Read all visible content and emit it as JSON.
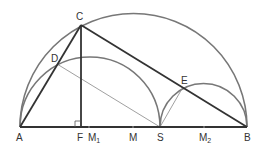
{
  "diagram": {
    "type": "geometry",
    "colors": {
      "arc": "#777777",
      "thick_line": "#333333",
      "thin_line": "#888888",
      "label": "#333333"
    },
    "points": {
      "A": {
        "label": "A",
        "x": 20,
        "y": 127
      },
      "B": {
        "label": "B",
        "x": 247,
        "y": 127
      },
      "C": {
        "label": "C",
        "x": 81,
        "y": 25
      },
      "D": {
        "label": "D",
        "x": 57,
        "y": 64
      },
      "E": {
        "label": "E",
        "x": 183,
        "y": 87
      },
      "F": {
        "label": "F",
        "x": 81,
        "y": 127
      },
      "M1": {
        "label": "M",
        "sub": "1",
        "x": 89,
        "y": 127
      },
      "M": {
        "label": "M",
        "x": 133,
        "y": 127
      },
      "S": {
        "label": "S",
        "x": 160,
        "y": 127
      },
      "M2": {
        "label": "M",
        "sub": "2",
        "x": 204,
        "y": 127
      }
    },
    "arcs": [
      {
        "name": "big-semicircle-AB",
        "center": "M",
        "radius": 113.5
      },
      {
        "name": "semicircle-AS",
        "center": "M1",
        "radius": 70
      },
      {
        "name": "semicircle-SB",
        "center": "M2",
        "radius": 43.5
      }
    ],
    "segments": [
      {
        "from": "A",
        "to": "B",
        "weight": "thick"
      },
      {
        "from": "A",
        "to": "C",
        "weight": "thick"
      },
      {
        "from": "C",
        "to": "B",
        "weight": "thick"
      },
      {
        "from": "C",
        "to": "F",
        "weight": "thick"
      },
      {
        "from": "D",
        "to": "S",
        "weight": "thin"
      },
      {
        "from": "S",
        "to": "E",
        "weight": "thin"
      }
    ],
    "right_angle_marker": {
      "at": "F"
    }
  }
}
